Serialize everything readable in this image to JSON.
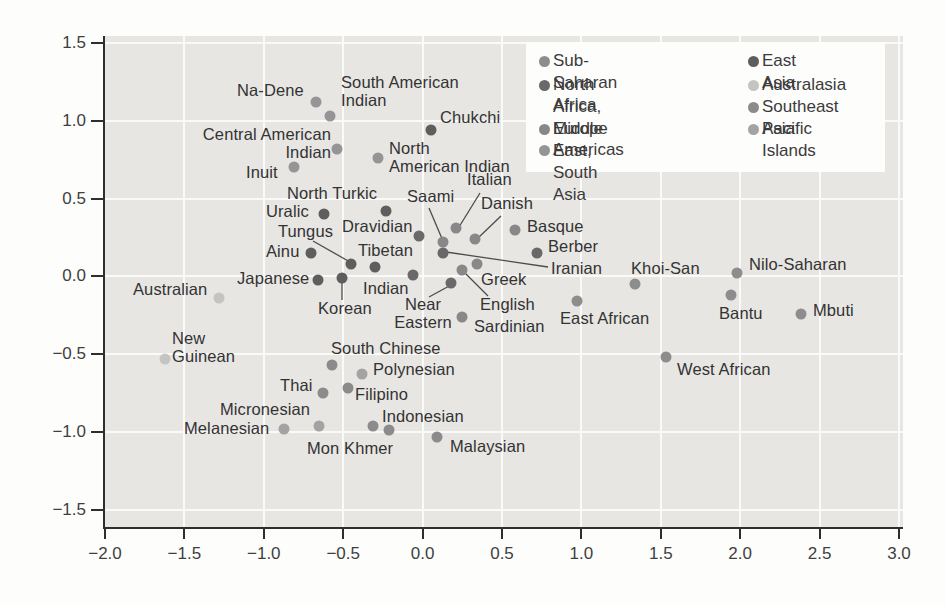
{
  "figure": {
    "background": "#fdfdfc",
    "plot_background": "#e7e6e3",
    "gridline_color": "#fafaf8",
    "axis_color": "#2e2e2e",
    "label_color": "#333333"
  },
  "groups": {
    "sub_saharan_africa": {
      "label": "Sub-Saharan Africa",
      "color": "#8d8d8d"
    },
    "north_africa_middle_east_south_asia": {
      "label": "North Africa, Middle\nEast, South Asia",
      "color": "#696969"
    },
    "europe": {
      "label": "Europe",
      "color": "#888888"
    },
    "americas": {
      "label": "Americas",
      "color": "#959595"
    },
    "east_asia": {
      "label": "East Asia",
      "color": "#5e5e5e"
    },
    "australasia": {
      "label": "Australasia",
      "color": "#c4c4c2"
    },
    "southeast_asia": {
      "label": "Southeast Asia",
      "color": "#8b8b8b"
    },
    "pacific_islands": {
      "label": "Pacific Islands",
      "color": "#a3a3a3"
    }
  },
  "legend": {
    "columns": [
      [
        "sub_saharan_africa",
        "north_africa_middle_east_south_asia",
        "europe",
        "americas"
      ],
      [
        "east_asia",
        "australasia",
        "southeast_asia",
        "pacific_islands"
      ]
    ]
  },
  "chart_data": {
    "type": "scatter",
    "title": "",
    "xlabel": "",
    "ylabel": "",
    "xlim": [
      -2.0,
      3.0
    ],
    "ylim": [
      -1.5,
      1.5
    ],
    "grid": true,
    "legend_position": "top-right",
    "x_ticks": [
      "−2.0",
      "−1.5",
      "−1.0",
      "−0.5",
      "0.0",
      "0.5",
      "1.0",
      "1.5",
      "2.0",
      "2.5",
      "3.0"
    ],
    "y_ticks": [
      "1.5",
      "1.0",
      "0.5",
      "0.0",
      "−0.5",
      "−1.0",
      "−1.5"
    ],
    "points": [
      {
        "name": "na-dene",
        "label": "Na-Dene",
        "group": "americas",
        "x": -0.67,
        "y": 1.12,
        "label_px": [
          237,
          82
        ],
        "align": "left",
        "line": null
      },
      {
        "name": "south-american-indian",
        "label": "South American\nIndian",
        "group": "americas",
        "x": -0.58,
        "y": 1.03,
        "label_px": [
          341,
          74
        ],
        "align": "left",
        "line": null
      },
      {
        "name": "central-american-indian",
        "label": "Central American\nIndian",
        "group": "americas",
        "x": -0.54,
        "y": 0.82,
        "label_px": [
          331,
          126
        ],
        "align": "right",
        "line": null
      },
      {
        "name": "north-american-indian",
        "label": "North\nAmerican Indian",
        "group": "americas",
        "x": -0.28,
        "y": 0.76,
        "label_px": [
          389,
          140
        ],
        "align": "left",
        "line": null
      },
      {
        "name": "inuit",
        "label": "Inuit",
        "group": "americas",
        "x": -0.81,
        "y": 0.7,
        "label_px": [
          246,
          164
        ],
        "align": "left",
        "line": null
      },
      {
        "name": "chukchi",
        "label": "Chukchi",
        "group": "east_asia",
        "x": 0.05,
        "y": 0.94,
        "label_px": [
          440,
          109
        ],
        "align": "left",
        "line": null
      },
      {
        "name": "north-turkic",
        "label": "North Turkic",
        "group": "east_asia",
        "x": -0.23,
        "y": 0.42,
        "label_px": [
          287,
          185
        ],
        "align": "left",
        "line": null
      },
      {
        "name": "uralic",
        "label": "Uralic",
        "group": "east_asia",
        "x": -0.62,
        "y": 0.4,
        "label_px": [
          266,
          203
        ],
        "align": "left",
        "line": null
      },
      {
        "name": "tungus",
        "label": "Tungus",
        "group": "east_asia",
        "x": -0.45,
        "y": 0.08,
        "label_px": [
          278,
          223
        ],
        "align": "left",
        "line": [
          313,
          241,
          350,
          262
        ]
      },
      {
        "name": "ainu",
        "label": "Ainu",
        "group": "east_asia",
        "x": -0.7,
        "y": 0.15,
        "label_px": [
          266,
          243
        ],
        "align": "left",
        "line": null
      },
      {
        "name": "tibetan",
        "label": "Tibetan",
        "group": "east_asia",
        "x": -0.3,
        "y": 0.06,
        "label_px": [
          358,
          242
        ],
        "align": "left",
        "line": null
      },
      {
        "name": "japanese",
        "label": "Japanese",
        "group": "east_asia",
        "x": -0.66,
        "y": -0.02,
        "label_px": [
          237,
          270
        ],
        "align": "left",
        "line": null
      },
      {
        "name": "korean",
        "label": "Korean",
        "group": "east_asia",
        "x": -0.51,
        "y": -0.01,
        "label_px": [
          318,
          300
        ],
        "align": "left",
        "line": [
          342,
          282,
          342,
          300
        ]
      },
      {
        "name": "saami",
        "label": "Saami",
        "group": "europe",
        "x": 0.13,
        "y": 0.22,
        "label_px": [
          407,
          188
        ],
        "align": "left",
        "line": [
          429,
          208,
          443,
          241
        ]
      },
      {
        "name": "italian",
        "label": "Italian",
        "group": "europe",
        "x": 0.21,
        "y": 0.31,
        "label_px": [
          467,
          171
        ],
        "align": "left",
        "line": [
          480,
          193,
          459,
          227
        ]
      },
      {
        "name": "danish",
        "label": "Danish",
        "group": "europe",
        "x": 0.33,
        "y": 0.24,
        "label_px": [
          481,
          195
        ],
        "align": "left",
        "line": [
          501,
          216,
          478,
          238
        ]
      },
      {
        "name": "basque",
        "label": "Basque",
        "group": "europe",
        "x": 0.58,
        "y": 0.3,
        "label_px": [
          527,
          218
        ],
        "align": "left",
        "line": null
      },
      {
        "name": "greek",
        "label": "Greek",
        "group": "europe",
        "x": 0.34,
        "y": 0.08,
        "label_px": [
          481,
          271
        ],
        "align": "left",
        "line": null
      },
      {
        "name": "english",
        "label": "English",
        "group": "europe",
        "x": 0.25,
        "y": 0.04,
        "label_px": [
          480,
          296
        ],
        "align": "left",
        "line": [
          488,
          296,
          464,
          272
        ]
      },
      {
        "name": "sardinian",
        "label": "Sardinian",
        "group": "europe",
        "x": 0.25,
        "y": -0.26,
        "label_px": [
          474,
          318
        ],
        "align": "left",
        "line": null
      },
      {
        "name": "dravidian",
        "label": "Dravidian",
        "group": "north_africa_middle_east_south_asia",
        "x": -0.02,
        "y": 0.26,
        "label_px": [
          342,
          218
        ],
        "align": "left",
        "line": null
      },
      {
        "name": "berber",
        "label": "Berber",
        "group": "north_africa_middle_east_south_asia",
        "x": 0.72,
        "y": 0.15,
        "label_px": [
          548,
          238
        ],
        "align": "left",
        "line": null
      },
      {
        "name": "iranian",
        "label": "Iranian",
        "group": "north_africa_middle_east_south_asia",
        "x": 0.13,
        "y": 0.15,
        "label_px": [
          551,
          260
        ],
        "align": "left",
        "line": [
          548,
          267,
          446,
          252
        ]
      },
      {
        "name": "near-eastern",
        "label": "Near\nEastern",
        "group": "north_africa_middle_east_south_asia",
        "x": 0.18,
        "y": -0.04,
        "label_px": [
          423,
          296
        ],
        "align": "center",
        "line": [
          429,
          297,
          451,
          285
        ]
      },
      {
        "name": "indian",
        "label": "Indian",
        "group": "north_africa_middle_east_south_asia",
        "x": -0.06,
        "y": 0.01,
        "label_px": [
          363,
          280
        ],
        "align": "left",
        "line": null
      },
      {
        "name": "khoi-san",
        "label": "Khoi-San",
        "group": "sub_saharan_africa",
        "x": 1.34,
        "y": -0.05,
        "label_px": [
          631,
          260
        ],
        "align": "left",
        "line": null
      },
      {
        "name": "nilo-saharan",
        "label": "Nilo-Saharan",
        "group": "sub_saharan_africa",
        "x": 1.98,
        "y": 0.02,
        "label_px": [
          749,
          256
        ],
        "align": "left",
        "line": null
      },
      {
        "name": "bantu",
        "label": "Bantu",
        "group": "sub_saharan_africa",
        "x": 1.94,
        "y": -0.12,
        "label_px": [
          719,
          305
        ],
        "align": "left",
        "line": null
      },
      {
        "name": "mbuti",
        "label": "Mbuti",
        "group": "sub_saharan_africa",
        "x": 2.38,
        "y": -0.24,
        "label_px": [
          813,
          302
        ],
        "align": "left",
        "line": null
      },
      {
        "name": "east-african",
        "label": "East African",
        "group": "sub_saharan_africa",
        "x": 0.97,
        "y": -0.16,
        "label_px": [
          560,
          310
        ],
        "align": "left",
        "line": null
      },
      {
        "name": "west-african",
        "label": "West African",
        "group": "sub_saharan_africa",
        "x": 1.53,
        "y": -0.52,
        "label_px": [
          677,
          361
        ],
        "align": "left",
        "line": null
      },
      {
        "name": "australian",
        "label": "Australian",
        "group": "australasia",
        "x": -1.28,
        "y": -0.14,
        "label_px": [
          133,
          281
        ],
        "align": "left",
        "line": null
      },
      {
        "name": "new-guinean",
        "label": "New\nGuinean",
        "group": "australasia",
        "x": -1.62,
        "y": -0.53,
        "label_px": [
          172,
          330
        ],
        "align": "left",
        "line": null
      },
      {
        "name": "south-chinese",
        "label": "South Chinese",
        "group": "southeast_asia",
        "x": -0.57,
        "y": -0.57,
        "label_px": [
          331,
          340
        ],
        "align": "left",
        "line": null
      },
      {
        "name": "thai",
        "label": "Thai",
        "group": "southeast_asia",
        "x": -0.63,
        "y": -0.75,
        "label_px": [
          280,
          377
        ],
        "align": "left",
        "line": null
      },
      {
        "name": "filipino",
        "label": "Filipino",
        "group": "southeast_asia",
        "x": -0.47,
        "y": -0.72,
        "label_px": [
          355,
          386
        ],
        "align": "left",
        "line": null
      },
      {
        "name": "mon-khmer",
        "label": "Mon Khmer",
        "group": "southeast_asia",
        "x": -0.31,
        "y": -0.96,
        "label_px": [
          307,
          440
        ],
        "align": "left",
        "line": null
      },
      {
        "name": "indonesian",
        "label": "Indonesian",
        "group": "southeast_asia",
        "x": -0.21,
        "y": -0.99,
        "label_px": [
          382,
          408
        ],
        "align": "left",
        "line": null
      },
      {
        "name": "malaysian",
        "label": "Malaysian",
        "group": "southeast_asia",
        "x": 0.09,
        "y": -1.03,
        "label_px": [
          450,
          438
        ],
        "align": "left",
        "line": null
      },
      {
        "name": "polynesian",
        "label": "Polynesian",
        "group": "pacific_islands",
        "x": -0.38,
        "y": -0.63,
        "label_px": [
          373,
          361
        ],
        "align": "left",
        "line": null
      },
      {
        "name": "micronesian",
        "label": "Micronesian",
        "group": "pacific_islands",
        "x": -0.65,
        "y": -0.96,
        "label_px": [
          220,
          401
        ],
        "align": "left",
        "line": null
      },
      {
        "name": "melanesian",
        "label": "Melanesian",
        "group": "pacific_islands",
        "x": -0.87,
        "y": -0.98,
        "label_px": [
          184,
          420
        ],
        "align": "left",
        "line": null
      }
    ]
  }
}
